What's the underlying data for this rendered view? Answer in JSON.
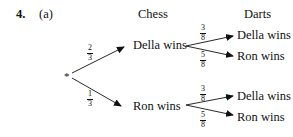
{
  "question": {
    "number": "4.",
    "part": "(a)"
  },
  "headers": {
    "stage1": "Chess",
    "stage2": "Darts"
  },
  "root": {
    "symbol": "*"
  },
  "stage1": [
    {
      "outcome": "Della wins",
      "probability": {
        "num": "2",
        "den": "3"
      }
    },
    {
      "outcome": "Ron wins",
      "probability": {
        "num": "1",
        "den": "3"
      }
    }
  ],
  "stage2": {
    "after_della": [
      {
        "outcome": "Della wins",
        "probability": {
          "num": "3",
          "den": "8"
        }
      },
      {
        "outcome": "Ron wins",
        "probability": {
          "num": "5",
          "den": "8"
        }
      }
    ],
    "after_ron": [
      {
        "outcome": "Della wins",
        "probability": {
          "num": "3",
          "den": "8"
        }
      },
      {
        "outcome": "Ron wins",
        "probability": {
          "num": "5",
          "den": "8"
        }
      }
    ]
  }
}
